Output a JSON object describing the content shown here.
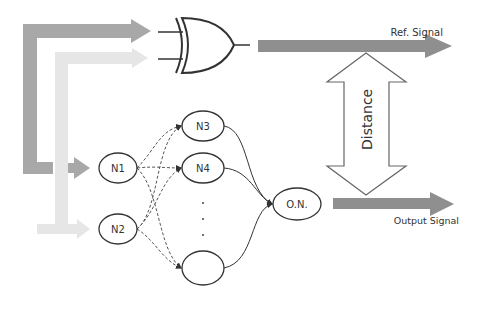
{
  "diagram": {
    "title": "",
    "colors": {
      "input_a_arrow": "#a8a8a8",
      "input_b_arrow": "#e6e6e6",
      "signal_arrow": "#8f8f8f",
      "stroke": "#333333",
      "background": "#ffffff"
    },
    "gate": {
      "type": "XOR",
      "label": ""
    },
    "labels": {
      "ref_signal": "Ref. Signal",
      "output_signal": "Output Signal",
      "distance": "Distance"
    },
    "nodes": [
      {
        "id": "N1",
        "label": "N1",
        "layer": "input"
      },
      {
        "id": "N2",
        "label": "N2",
        "layer": "input"
      },
      {
        "id": "N3",
        "label": "N3",
        "layer": "hidden"
      },
      {
        "id": "N4",
        "label": "N4",
        "layer": "hidden"
      },
      {
        "id": "Nn",
        "label": "",
        "layer": "hidden"
      },
      {
        "id": "ON",
        "label": "O.N.",
        "layer": "output"
      }
    ],
    "ellipsis": "· · ·",
    "edges": [
      {
        "from": "N1",
        "to": "N3",
        "style": "dashed"
      },
      {
        "from": "N1",
        "to": "N4",
        "style": "dashed"
      },
      {
        "from": "N1",
        "to": "Nn",
        "style": "dashed"
      },
      {
        "from": "N2",
        "to": "N3",
        "style": "dashed"
      },
      {
        "from": "N2",
        "to": "N4",
        "style": "dashed"
      },
      {
        "from": "N2",
        "to": "Nn",
        "style": "dashed"
      },
      {
        "from": "N3",
        "to": "ON",
        "style": "solid"
      },
      {
        "from": "N4",
        "to": "ON",
        "style": "solid"
      },
      {
        "from": "Nn",
        "to": "ON",
        "style": "solid"
      }
    ]
  }
}
